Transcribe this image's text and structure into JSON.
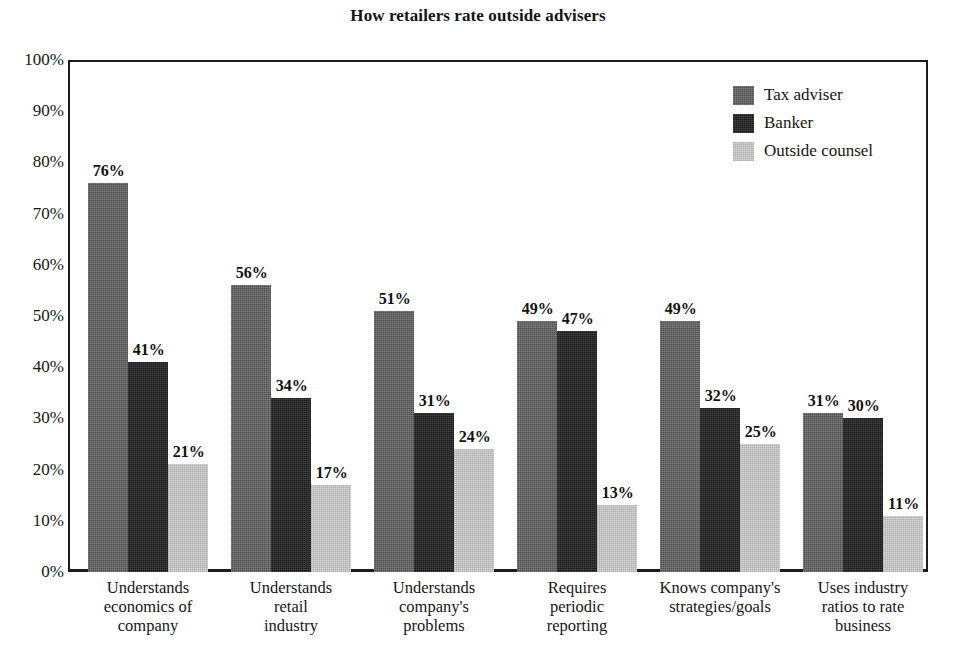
{
  "chart_data": {
    "type": "bar",
    "title": "How retailers rate outside advisers",
    "xlabel": "",
    "ylabel": "",
    "ylim": [
      0,
      100
    ],
    "grid": false,
    "legend_position": "top-right",
    "y_ticks": [
      "0%",
      "10%",
      "20%",
      "30%",
      "40%",
      "50%",
      "60%",
      "70%",
      "80%",
      "90%",
      "100%"
    ],
    "y_tick_values": [
      0,
      10,
      20,
      30,
      40,
      50,
      60,
      70,
      80,
      90,
      100
    ],
    "categories": [
      "Understands\neconomics of\ncompany",
      "Understands\nretail\nindustry",
      "Understands\ncompany's\nproblems",
      "Requires\nperiodic\nreporting",
      "Knows company's\nstrategies/goals",
      "Uses industry\nratios to rate\nbusiness"
    ],
    "category_lines": [
      [
        "Understands",
        "economics of",
        "company"
      ],
      [
        "Understands",
        "retail",
        "industry"
      ],
      [
        "Understands",
        "company's",
        "problems"
      ],
      [
        "Requires",
        "periodic",
        "reporting"
      ],
      [
        "Knows company's",
        "strategies/goals"
      ],
      [
        "Uses industry",
        "ratios to rate",
        "business"
      ]
    ],
    "series": [
      {
        "name": "Tax adviser",
        "color": "#4e4e4e",
        "values": [
          76,
          56,
          51,
          49,
          49,
          31
        ],
        "labels": [
          "76%",
          "56%",
          "51%",
          "49%",
          "49%",
          "31%"
        ]
      },
      {
        "name": "Banker",
        "color": "#1b1b1b",
        "values": [
          41,
          34,
          31,
          47,
          32,
          30
        ],
        "labels": [
          "41%",
          "34%",
          "31%",
          "47%",
          "32%",
          "30%"
        ]
      },
      {
        "name": "Outside counsel",
        "color": "#d6d6d6",
        "values": [
          21,
          17,
          24,
          13,
          25,
          11
        ],
        "labels": [
          "21%",
          "17%",
          "24%",
          "13%",
          "25%",
          "11%"
        ]
      }
    ]
  },
  "legend": {
    "items": [
      {
        "label": "Tax adviser",
        "swatch_name": "legend-swatch-tax-adviser"
      },
      {
        "label": "Banker",
        "swatch_name": "legend-swatch-banker"
      },
      {
        "label": "Outside counsel",
        "swatch_name": "legend-swatch-outside-counsel"
      }
    ]
  }
}
